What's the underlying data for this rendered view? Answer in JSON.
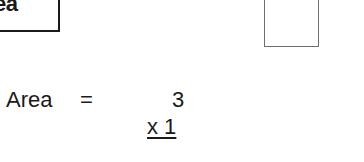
{
  "header": {
    "label": "ea"
  },
  "figure": {
    "shape": "rectangle"
  },
  "equation": {
    "label": "Area",
    "equals": "=",
    "factor_top": "3",
    "factor_bottom": "x 1"
  }
}
